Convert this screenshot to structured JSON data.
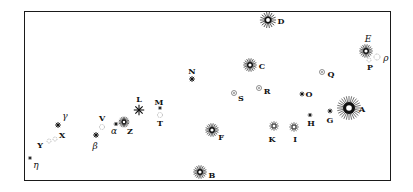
{
  "diagram": {
    "type": "star-chart",
    "frame": {
      "left": 24,
      "top": 11,
      "right": 391,
      "bottom": 181,
      "stroke": "#1a1a1a"
    },
    "stars": [
      {
        "id": "D",
        "label": "D",
        "kind": "bright",
        "x": 268,
        "y": 20,
        "r": 6,
        "lx": 281,
        "ly": 21
      },
      {
        "id": "E",
        "label": "E",
        "kind": "bright",
        "x": 366,
        "y": 51,
        "r": 5,
        "lx": 368,
        "ly": 39,
        "italic": true
      },
      {
        "id": "rho",
        "label": "ρ",
        "kind": "dotted",
        "x": 377,
        "y": 57,
        "r": 3,
        "lx": 386,
        "ly": 58,
        "italic": true
      },
      {
        "id": "P",
        "label": "P",
        "kind": "dotted",
        "x": 369,
        "y": 60,
        "r": 2,
        "lx": 370,
        "ly": 67
      },
      {
        "id": "C",
        "label": "C",
        "kind": "bright",
        "x": 250,
        "y": 65,
        "r": 5,
        "lx": 262,
        "ly": 66
      },
      {
        "id": "N",
        "label": "N",
        "kind": "small",
        "x": 192,
        "y": 79,
        "r": 2.5,
        "lx": 192,
        "ly": 71
      },
      {
        "id": "Q",
        "label": "Q",
        "kind": "circle",
        "x": 322,
        "y": 72,
        "r": 2.5,
        "lx": 331,
        "ly": 74
      },
      {
        "id": "R",
        "label": "R",
        "kind": "circle",
        "x": 259,
        "y": 88,
        "r": 2.5,
        "lx": 267,
        "ly": 91
      },
      {
        "id": "S",
        "label": "S",
        "kind": "circle",
        "x": 234,
        "y": 93,
        "r": 2.5,
        "lx": 241,
        "ly": 98
      },
      {
        "id": "O",
        "label": "O",
        "kind": "small",
        "x": 302,
        "y": 94,
        "r": 2,
        "lx": 309,
        "ly": 94
      },
      {
        "id": "A",
        "label": "A",
        "kind": "brightest",
        "x": 349,
        "y": 108,
        "r": 8,
        "lx": 362,
        "ly": 109
      },
      {
        "id": "L",
        "label": "L",
        "kind": "cross",
        "x": 139,
        "y": 110,
        "r": 4,
        "lx": 139,
        "ly": 99
      },
      {
        "id": "M",
        "label": "M",
        "kind": "tiny",
        "x": 160,
        "y": 108,
        "r": 1.5,
        "lx": 159,
        "ly": 102
      },
      {
        "id": "T",
        "label": "T",
        "kind": "dotted",
        "x": 160,
        "y": 115,
        "r": 2.5,
        "lx": 160,
        "ly": 123
      },
      {
        "id": "G",
        "label": "G",
        "kind": "small",
        "x": 330,
        "y": 111,
        "r": 2,
        "lx": 330,
        "ly": 120
      },
      {
        "id": "H",
        "label": "H",
        "kind": "tiny",
        "x": 310,
        "y": 115,
        "r": 1.8,
        "lx": 311,
        "ly": 123
      },
      {
        "id": "Z",
        "label": "Z",
        "kind": "bright",
        "x": 124,
        "y": 122,
        "r": 4,
        "lx": 130,
        "ly": 131
      },
      {
        "id": "gamma",
        "label": "γ",
        "kind": "small",
        "x": 58,
        "y": 125,
        "r": 2.5,
        "lx": 65,
        "ly": 116,
        "italic": true
      },
      {
        "id": "V",
        "label": "V",
        "kind": "dotted",
        "x": 102,
        "y": 127,
        "r": 2.5,
        "lx": 102,
        "ly": 118
      },
      {
        "id": "alpha",
        "label": "α",
        "kind": "tiny",
        "x": 116,
        "y": 124,
        "r": 1.8,
        "lx": 114,
        "ly": 131,
        "italic": true
      },
      {
        "id": "K",
        "label": "K",
        "kind": "open",
        "x": 274,
        "y": 126,
        "r": 4,
        "lx": 272,
        "ly": 139
      },
      {
        "id": "I",
        "label": "I",
        "kind": "open",
        "x": 294,
        "y": 127,
        "r": 4,
        "lx": 295,
        "ly": 139
      },
      {
        "id": "F",
        "label": "F",
        "kind": "bright",
        "x": 212,
        "y": 130,
        "r": 5,
        "lx": 221,
        "ly": 137
      },
      {
        "id": "X",
        "label": "X",
        "kind": "dotted",
        "x": 55,
        "y": 139,
        "r": 2,
        "lx": 62,
        "ly": 135
      },
      {
        "id": "Y",
        "label": "Y",
        "kind": "dotted",
        "x": 49,
        "y": 141,
        "r": 2,
        "lx": 40,
        "ly": 145
      },
      {
        "id": "beta",
        "label": "β",
        "kind": "small",
        "x": 96,
        "y": 135,
        "r": 2.5,
        "lx": 95,
        "ly": 146,
        "italic": true
      },
      {
        "id": "eta",
        "label": "η",
        "kind": "tiny",
        "x": 30,
        "y": 158,
        "r": 1.5,
        "lx": 36,
        "ly": 165,
        "italic": true
      },
      {
        "id": "B",
        "label": "B",
        "kind": "bright",
        "x": 200,
        "y": 172,
        "r": 5,
        "lx": 212,
        "ly": 175
      }
    ]
  }
}
